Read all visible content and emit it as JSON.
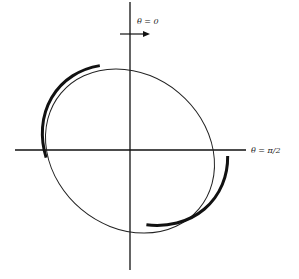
{
  "diagram": {
    "type": "polar-ellipse",
    "labels": {
      "theta_zero": "θ = 0",
      "theta_half_pi": "θ = π/2"
    },
    "axes": {
      "vertical": {
        "x": 130,
        "y1": 2,
        "y2": 270
      },
      "horizontal": {
        "y": 150,
        "x1": 15,
        "x2": 246
      }
    },
    "rotation_arrow": {
      "direction": "clockwise",
      "from_x": 120,
      "to_x": 150,
      "y": 34
    },
    "ellipse": {
      "cx": 130,
      "cy": 151,
      "rx": 87,
      "ry": 80,
      "rotation_deg": 40,
      "thick_segments": [
        "left",
        "right"
      ]
    },
    "colors": {
      "stroke": "#111111",
      "background": "#ffffff"
    }
  }
}
